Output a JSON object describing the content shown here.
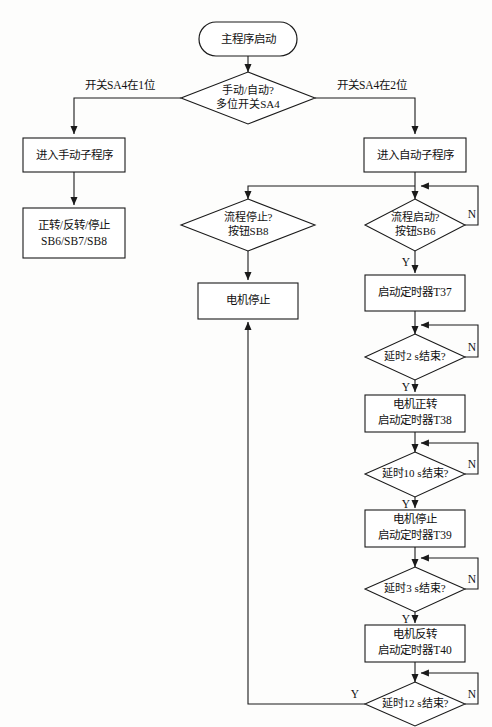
{
  "diagram": {
    "type": "flowchart",
    "title": "",
    "orientation": "top-down",
    "nodes": {
      "start": {
        "id": "start",
        "shape": "terminator",
        "label": "主程序启动"
      },
      "mode_decision": {
        "id": "mode_decision",
        "shape": "diamond",
        "line1": "手动/自动?",
        "line2": "多位开关SA4"
      },
      "manual_sub": {
        "id": "manual_sub",
        "shape": "process",
        "label": "进入手动子程序"
      },
      "manual_ops": {
        "id": "manual_ops",
        "shape": "process",
        "line1": "正转/反转/停止",
        "line2": "SB6/SB7/SB8"
      },
      "auto_sub": {
        "id": "auto_sub",
        "shape": "process",
        "label": "进入自动子程序"
      },
      "stop_decision": {
        "id": "stop_decision",
        "shape": "diamond",
        "line1": "流程停止?",
        "line2": "按钮SB8"
      },
      "motor_stop_box": {
        "id": "motor_stop_box",
        "shape": "process",
        "label": "电机停止"
      },
      "start_decision": {
        "id": "start_decision",
        "shape": "diamond",
        "line1": "流程启动?",
        "line2": "按钮SB6"
      },
      "timer_t37": {
        "id": "timer_t37",
        "shape": "process",
        "label": "启动定时器T37"
      },
      "delay2": {
        "id": "delay2",
        "shape": "diamond",
        "label": "延时2 s结束?"
      },
      "motor_fwd_t38": {
        "id": "motor_fwd_t38",
        "shape": "process",
        "line1": "电机正转",
        "line2": "启动定时器T38"
      },
      "delay10": {
        "id": "delay10",
        "shape": "diamond",
        "label": "延时10 s结束?"
      },
      "motor_stop_t39": {
        "id": "motor_stop_t39",
        "shape": "process",
        "line1": "电机停止",
        "line2": "启动定时器T39"
      },
      "delay3": {
        "id": "delay3",
        "shape": "diamond",
        "label": "延时3 s结束?"
      },
      "motor_rev_t40": {
        "id": "motor_rev_t40",
        "shape": "process",
        "line1": "电机反转",
        "line2": "启动定时器T40"
      },
      "delay12": {
        "id": "delay12",
        "shape": "diamond",
        "label": "延时12 s结束?"
      }
    },
    "edge_labels": {
      "switch_pos1": "开关SA4在1位",
      "switch_pos2": "开关SA4在2位",
      "start_decision_n": "N",
      "start_decision_y": "Y",
      "delay2_n": "N",
      "delay2_y": "Y",
      "delay10_n": "N",
      "delay10_y": "Y",
      "delay3_n": "N",
      "delay3_y": "Y",
      "delay12_n": "N",
      "delay12_y": "Y"
    },
    "colors": {
      "background": "#fdfdfc",
      "stroke": "#1a1a1a",
      "node_fill": "#ffffff",
      "text": "#111111"
    }
  }
}
